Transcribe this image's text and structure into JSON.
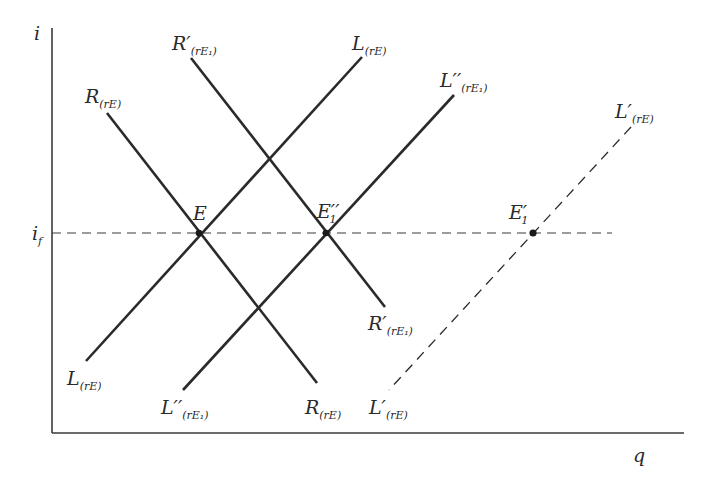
{
  "diagram": {
    "axes": {
      "y_label": "i",
      "x_label": "q",
      "i_f_label": "i",
      "i_f_sub": "f",
      "origin": [
        52,
        433
      ],
      "y_top": 28,
      "x_right": 684
    },
    "reference_line": {
      "name": "i_f",
      "y": 233,
      "x_start": 52,
      "x_end": 612,
      "style": "dashed"
    },
    "curves": [
      {
        "id": "R",
        "main": "R",
        "prime": "",
        "sub": "(rE)",
        "from": [
          107,
          113
        ],
        "to": [
          317,
          383
        ],
        "style": "solid"
      },
      {
        "id": "R1",
        "main": "R",
        "prime": "′",
        "sub": "(rE₁)",
        "from": [
          191,
          58
        ],
        "to": [
          385,
          307
        ],
        "style": "solid"
      },
      {
        "id": "L",
        "main": "L",
        "prime": "",
        "sub": "(rE)",
        "from": [
          362,
          57
        ],
        "to": [
          86,
          361
        ],
        "style": "solid"
      },
      {
        "id": "L2",
        "main": "L",
        "prime": "′′",
        "sub": "(rE₁)",
        "from": [
          454,
          95
        ],
        "to": [
          183,
          390
        ],
        "style": "solid"
      },
      {
        "id": "L1",
        "main": "L",
        "prime": "′",
        "sub": "(rE)",
        "from": [
          631,
          127
        ],
        "to": [
          389,
          390
        ],
        "style": "dashed"
      }
    ],
    "labels": [
      {
        "for": "R-top",
        "main": "R",
        "sub": "(rE)",
        "x": 85,
        "y": 103
      },
      {
        "for": "R-bottom",
        "main": "R",
        "sub": "(rE)",
        "x": 305,
        "y": 414
      },
      {
        "for": "R1-top",
        "main": "R′",
        "sub": "(rE₁)",
        "x": 172,
        "y": 50
      },
      {
        "for": "R1-bottom",
        "main": "R′",
        "sub": "(rE₁)",
        "x": 368,
        "y": 330
      },
      {
        "for": "L-top",
        "main": "L",
        "sub": "(rE)",
        "x": 352,
        "y": 50
      },
      {
        "for": "L-bottom",
        "main": "L",
        "sub": "(rE)",
        "x": 67,
        "y": 385
      },
      {
        "for": "L2-top",
        "main": "L′′",
        "sub": "(rE₁)",
        "x": 440,
        "y": 87
      },
      {
        "for": "L2-bottom",
        "main": "L′′",
        "sub": "(rE₁)",
        "x": 161,
        "y": 414
      },
      {
        "for": "L1-top",
        "main": "L′",
        "sub": "(rE)",
        "x": 615,
        "y": 118
      },
      {
        "for": "L1-bottom",
        "main": "L′",
        "sub": "(rE)",
        "x": 369,
        "y": 414
      }
    ],
    "points": [
      {
        "name": "E",
        "label": "E",
        "sub": "",
        "x": 199,
        "y": 233,
        "label_x": 194,
        "label_y": 220
      },
      {
        "name": "E1pp",
        "label": "E′′",
        "sub": "1",
        "x": 326,
        "y": 233,
        "label_x": 318,
        "label_y": 217
      },
      {
        "name": "E1p",
        "label": "E′",
        "sub": "1",
        "x": 533,
        "y": 233,
        "label_x": 510,
        "label_y": 219
      }
    ],
    "colors": {
      "line": "#2a2a2a",
      "axis": "#3a3a3a",
      "background": "#ffffff"
    }
  }
}
